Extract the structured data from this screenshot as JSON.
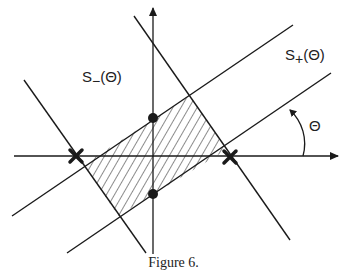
{
  "figure": {
    "caption": "Figure 6.",
    "labels": {
      "s_minus": {
        "base": "S",
        "sub": "−",
        "arg": "(Θ)"
      },
      "s_plus": {
        "base": "S",
        "sub": "+",
        "arg": "(Θ)"
      },
      "angle": "Θ"
    },
    "markers": {
      "crosses": [
        {
          "x": 76,
          "y": 156
        },
        {
          "x": 230,
          "y": 157
        }
      ],
      "dots": [
        {
          "x": 153,
          "y": 118
        },
        {
          "x": 153,
          "y": 194
        }
      ]
    },
    "shaded_region": "hatched parallelogram",
    "line_color": "#1a1a1a"
  }
}
